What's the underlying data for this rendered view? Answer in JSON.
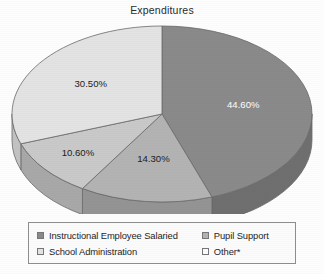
{
  "chart_data": {
    "type": "pie",
    "title": "Expenditures",
    "categories": [
      "Instructional Employee Salaried",
      "Pupil Support",
      "School Administration",
      "Other*"
    ],
    "values": [
      44.6,
      14.3,
      10.6,
      30.5
    ],
    "labels": [
      "44.60%",
      "14.30%",
      "10.60%",
      "30.50%"
    ],
    "colors": [
      "#8a8a8a",
      "#b3b3b3",
      "#c9c9c9",
      "#e3e3e3"
    ],
    "side_colors": [
      "#6f6f6f",
      "#949494",
      "#a8a8a8",
      "#c2c2c2"
    ],
    "label_colors": [
      "#ffffff",
      "#1c1c1c",
      "#1c1c1c",
      "#1c1c1c"
    ],
    "start_angle_deg": 0,
    "direction": "clockwise",
    "three_d": true,
    "legend_position": "bottom",
    "grid": false,
    "xlabel": "",
    "ylabel": ""
  },
  "legend": {
    "items": [
      {
        "label": "Instructional Employee Salaried",
        "color": "#8a8a8a"
      },
      {
        "label": "Pupil Support",
        "color": "#b3b3b3"
      },
      {
        "label": "School Administration",
        "color": "#e3e3e3"
      },
      {
        "label": "Other*",
        "color": "#fbfbfb"
      }
    ]
  }
}
